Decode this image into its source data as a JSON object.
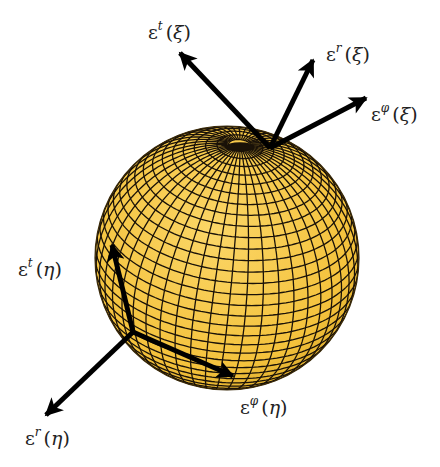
{
  "figure": {
    "sphere": {
      "fill": "#f7c843",
      "grid_color": "#1a1208",
      "cx": 227,
      "cy": 258,
      "r": 132,
      "pole": [
        240,
        145
      ]
    },
    "vectors": [
      {
        "id": "et_xi",
        "from": [
          270,
          148
        ],
        "to": [
          180,
          53
        ]
      },
      {
        "id": "er_xi",
        "from": [
          270,
          148
        ],
        "to": [
          313,
          60
        ]
      },
      {
        "id": "ephi_xi",
        "from": [
          270,
          148
        ],
        "to": [
          366,
          98
        ]
      },
      {
        "id": "et_eta",
        "from": [
          133,
          332
        ],
        "to": [
          112,
          245
        ]
      },
      {
        "id": "er_eta",
        "from": [
          133,
          332
        ],
        "to": [
          46,
          415
        ]
      },
      {
        "id": "ephi_eta",
        "from": [
          133,
          332
        ],
        "to": [
          233,
          376
        ]
      }
    ],
    "labels": [
      {
        "id": "label-et-xi",
        "symbol": "ε",
        "sup": "t",
        "arg": "ξ",
        "x": 148,
        "y": 22
      },
      {
        "id": "label-er-xi",
        "symbol": "ε",
        "sup": "r",
        "arg": "ξ",
        "x": 326,
        "y": 44
      },
      {
        "id": "label-ephi-xi",
        "symbol": "ε",
        "sup": "φ",
        "arg": "ξ",
        "x": 371,
        "y": 104
      },
      {
        "id": "label-et-eta",
        "symbol": "ε",
        "sup": "t",
        "arg": "η",
        "x": 18,
        "y": 259
      },
      {
        "id": "label-ephi-eta",
        "symbol": "ε",
        "sup": "φ",
        "arg": "η",
        "x": 240,
        "y": 397
      },
      {
        "id": "label-er-eta",
        "symbol": "ε",
        "sup": "r",
        "arg": "η",
        "x": 25,
        "y": 428
      }
    ]
  }
}
